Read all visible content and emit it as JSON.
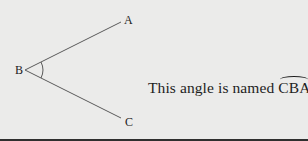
{
  "diagram": {
    "vertices": [
      {
        "label": "A",
        "x": 122,
        "y": 22
      },
      {
        "label": "B",
        "x": 25,
        "y": 70
      },
      {
        "label": "C",
        "x": 122,
        "y": 118
      }
    ],
    "angle_vertex": "B",
    "line_color": "#555555",
    "background": "#ebebea"
  },
  "caption": {
    "prefix": "This angle is named ",
    "angle_name": "CBA",
    "suffix": "."
  }
}
